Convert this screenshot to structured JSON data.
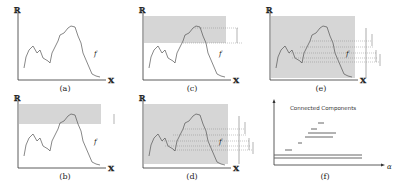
{
  "figure": {
    "panels": [
      {
        "id": "a",
        "caption": "(a)",
        "y_axis_label": "ℝ",
        "x_axis_label": "𝕏",
        "f_label": "f",
        "shaded": false
      },
      {
        "id": "b",
        "caption": "(b)",
        "y_axis_label": "ℝ",
        "x_axis_label": "𝕏",
        "f_label": "f",
        "shaded": "top-band"
      },
      {
        "id": "c",
        "caption": "(c)",
        "y_axis_label": "ℝ",
        "x_axis_label": "𝕏",
        "f_label": "f",
        "shaded": "upper-region"
      },
      {
        "id": "d",
        "caption": "(d)",
        "y_axis_label": "ℝ",
        "x_axis_label": "𝕏",
        "f_label": "f",
        "shaded": "most-region"
      },
      {
        "id": "e",
        "caption": "(e)",
        "y_axis_label": "ℝ",
        "x_axis_label": "𝕏",
        "f_label": "f",
        "shaded": "full-region"
      },
      {
        "id": "f",
        "caption": "(f)",
        "title": "Connected Components",
        "x_axis_label": "α"
      }
    ],
    "colors": {
      "shade": "#d6d6d6",
      "line": "#555555",
      "axis": "#333333",
      "bar": "#666666"
    }
  }
}
